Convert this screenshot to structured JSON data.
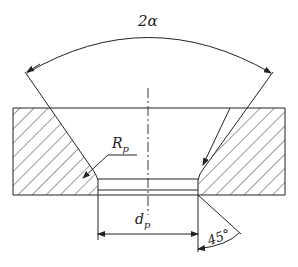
{
  "diagram": {
    "type": "technical-drawing",
    "labels": {
      "angle_top": "2α",
      "radius": "R",
      "radius_sub": "p",
      "diameter": "d",
      "diameter_sub": "p",
      "angle_bottom": "45°"
    },
    "colors": {
      "line": "#222222",
      "background": "#ffffff"
    }
  }
}
